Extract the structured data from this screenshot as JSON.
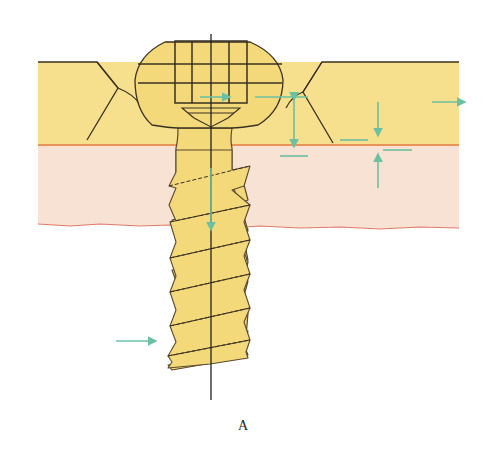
{
  "figure": {
    "caption": "A",
    "layers": [
      {
        "name": "cortical-bone-layer",
        "color": "#f6e08e"
      },
      {
        "name": "cancellous-bone-layer",
        "color": "#f8e2d4"
      }
    ],
    "colors": {
      "screw_fill": "#f3d97a",
      "outline": "#3a3020",
      "cortex_boundary": "#e8935a",
      "bottom_boundary": "#e07b6a",
      "arrow": "#6cc0a2",
      "axis_line": "#222222"
    },
    "arrows": [
      {
        "name": "head-compression-arrow",
        "direction": "right"
      },
      {
        "name": "plate-shift-arrow",
        "direction": "right"
      },
      {
        "name": "cortex-gap-arrow-vertical",
        "direction": "up-down"
      },
      {
        "name": "cortex-downward-arrow",
        "direction": "down"
      },
      {
        "name": "cortex-upward-arrow",
        "direction": "up"
      },
      {
        "name": "right-edge-arrow",
        "direction": "right"
      },
      {
        "name": "shaft-axis-arrow",
        "direction": "down"
      },
      {
        "name": "tip-lateral-arrow",
        "direction": "right"
      }
    ]
  }
}
